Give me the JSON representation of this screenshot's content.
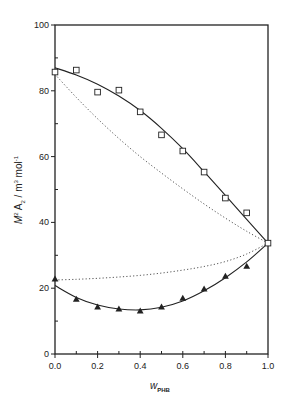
{
  "chart_data": {
    "type": "scatter",
    "title": "",
    "xlabel": "w_PHB",
    "xlabel_main": "w",
    "xlabel_sub": "PHB",
    "ylabel": "M² A₂ / m³ mol⁻¹",
    "ylabel_parts": {
      "M": "M",
      "M_sup": "2",
      "A": " A",
      "A_sub": "2",
      "unit": " / m",
      "unit_sup": "3",
      "mol": " mol",
      "mol_sup": "-1"
    },
    "xlim": [
      0.0,
      1.0
    ],
    "ylim": [
      0,
      100
    ],
    "xticks": [
      0.0,
      0.2,
      0.4,
      0.6,
      0.8,
      1.0
    ],
    "xtick_labels": [
      "0.0",
      "0.2",
      "0.4",
      "0.6",
      "0.8",
      "1.0"
    ],
    "yticks": [
      0,
      20,
      40,
      60,
      80,
      100
    ],
    "ytick_labels": [
      "0",
      "20",
      "40",
      "60",
      "80",
      "100"
    ],
    "x_minor_step": 0.1,
    "y_minor_step": 10,
    "grid": false,
    "legend": null,
    "series": [
      {
        "name": "open squares",
        "marker": "square-open",
        "x": [
          0.0,
          0.1,
          0.2,
          0.3,
          0.4,
          0.5,
          0.6,
          0.7,
          0.8,
          0.9,
          1.0
        ],
        "y": [
          85.7,
          86.3,
          79.6,
          80.2,
          73.6,
          66.6,
          61.7,
          55.3,
          47.4,
          42.9,
          33.7
        ]
      },
      {
        "name": "filled triangles",
        "marker": "triangle-filled",
        "x": [
          0.0,
          0.1,
          0.2,
          0.3,
          0.4,
          0.5,
          0.6,
          0.7,
          0.8,
          0.9
        ],
        "y": [
          22.8,
          16.7,
          14.3,
          13.7,
          13.1,
          14.3,
          17.0,
          19.8,
          23.7,
          26.7
        ]
      },
      {
        "name": "upper solid fit",
        "line": "solid",
        "x": [
          0.0,
          0.1,
          0.2,
          0.3,
          0.4,
          0.5,
          0.6,
          0.7,
          0.8,
          0.9,
          1.0
        ],
        "y": [
          87.0,
          84.8,
          82.0,
          78.4,
          74.0,
          68.6,
          62.4,
          55.4,
          48.2,
          40.9,
          33.7
        ]
      },
      {
        "name": "upper dotted",
        "line": "dotted",
        "x": [
          0.0,
          0.1,
          0.2,
          0.3,
          0.4,
          0.5,
          0.6,
          0.7,
          0.8,
          0.9,
          1.0
        ],
        "y": [
          85.0,
          78.0,
          71.5,
          65.5,
          60.0,
          55.0,
          50.2,
          45.6,
          41.3,
          37.3,
          33.7
        ]
      },
      {
        "name": "lower dotted",
        "line": "dotted",
        "x": [
          0.0,
          0.1,
          0.2,
          0.3,
          0.4,
          0.5,
          0.6,
          0.7,
          0.8,
          0.9,
          1.0
        ],
        "y": [
          22.5,
          22.7,
          23.0,
          23.4,
          23.9,
          24.6,
          25.5,
          26.6,
          28.1,
          30.4,
          33.7
        ]
      },
      {
        "name": "lower solid fit",
        "line": "solid",
        "x": [
          0.0,
          0.1,
          0.2,
          0.3,
          0.4,
          0.5,
          0.6,
          0.7,
          0.8,
          0.9,
          1.0
        ],
        "y": [
          20.8,
          17.2,
          14.9,
          13.7,
          13.4,
          14.2,
          16.1,
          19.2,
          23.2,
          28.0,
          33.7
        ]
      }
    ]
  },
  "layout": {
    "plot_left": 55,
    "plot_right": 268,
    "plot_top": 25,
    "plot_bottom": 354,
    "ink_color": "#222222",
    "dot_color": "#555555"
  }
}
